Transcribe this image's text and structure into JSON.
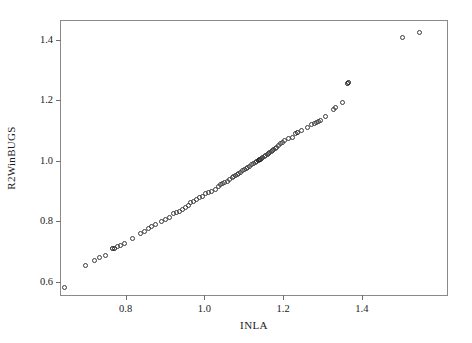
{
  "chart_data": {
    "type": "scatter",
    "title": "",
    "xlabel": "INLA",
    "ylabel": "R2WinBUGS",
    "xlim": [
      0.636,
      1.616
    ],
    "ylim": [
      0.557,
      1.462
    ],
    "xticks": [
      0.8,
      1.0,
      1.2,
      1.4
    ],
    "xticklabels": [
      "0.8",
      "1.0",
      "1.2",
      "1.4"
    ],
    "yticks": [
      0.6,
      0.8,
      1.0,
      1.2,
      1.4
    ],
    "yticklabels": [
      "0.6",
      "0.8",
      "1.0",
      "1.2",
      "1.4"
    ],
    "grid": false,
    "legend": null,
    "marker": "open-circle",
    "marker_color": "#3a3a3a",
    "points": [
      {
        "x": 0.644,
        "y": 0.581
      },
      {
        "x": 0.697,
        "y": 0.653
      },
      {
        "x": 0.72,
        "y": 0.672
      },
      {
        "x": 0.733,
        "y": 0.681
      },
      {
        "x": 0.748,
        "y": 0.688
      },
      {
        "x": 0.767,
        "y": 0.709,
        "dark": true
      },
      {
        "x": 0.772,
        "y": 0.712,
        "dark": true
      },
      {
        "x": 0.78,
        "y": 0.716
      },
      {
        "x": 0.788,
        "y": 0.722
      },
      {
        "x": 0.798,
        "y": 0.728
      },
      {
        "x": 0.818,
        "y": 0.744
      },
      {
        "x": 0.838,
        "y": 0.759
      },
      {
        "x": 0.848,
        "y": 0.766
      },
      {
        "x": 0.858,
        "y": 0.775
      },
      {
        "x": 0.866,
        "y": 0.784
      },
      {
        "x": 0.876,
        "y": 0.791
      },
      {
        "x": 0.891,
        "y": 0.8
      },
      {
        "x": 0.901,
        "y": 0.806
      },
      {
        "x": 0.911,
        "y": 0.812
      },
      {
        "x": 0.921,
        "y": 0.825
      },
      {
        "x": 0.929,
        "y": 0.831
      },
      {
        "x": 0.936,
        "y": 0.834
      },
      {
        "x": 0.944,
        "y": 0.841
      },
      {
        "x": 0.951,
        "y": 0.847
      },
      {
        "x": 0.959,
        "y": 0.853
      },
      {
        "x": 0.964,
        "y": 0.862
      },
      {
        "x": 0.972,
        "y": 0.866
      },
      {
        "x": 0.979,
        "y": 0.872
      },
      {
        "x": 0.987,
        "y": 0.878
      },
      {
        "x": 0.995,
        "y": 0.881
      },
      {
        "x": 1.002,
        "y": 0.891
      },
      {
        "x": 1.01,
        "y": 0.894
      },
      {
        "x": 1.018,
        "y": 0.9
      },
      {
        "x": 1.028,
        "y": 0.906
      },
      {
        "x": 1.036,
        "y": 0.916
      },
      {
        "x": 1.041,
        "y": 0.922
      },
      {
        "x": 1.046,
        "y": 0.925
      },
      {
        "x": 1.051,
        "y": 0.928
      },
      {
        "x": 1.059,
        "y": 0.931
      },
      {
        "x": 1.064,
        "y": 0.937
      },
      {
        "x": 1.071,
        "y": 0.944
      },
      {
        "x": 1.074,
        "y": 0.95
      },
      {
        "x": 1.079,
        "y": 0.953
      },
      {
        "x": 1.084,
        "y": 0.956
      },
      {
        "x": 1.087,
        "y": 0.959
      },
      {
        "x": 1.092,
        "y": 0.962
      },
      {
        "x": 1.097,
        "y": 0.969
      },
      {
        "x": 1.102,
        "y": 0.972
      },
      {
        "x": 1.107,
        "y": 0.975
      },
      {
        "x": 1.11,
        "y": 0.978
      },
      {
        "x": 1.115,
        "y": 0.981
      },
      {
        "x": 1.12,
        "y": 0.987
      },
      {
        "x": 1.125,
        "y": 0.991
      },
      {
        "x": 1.13,
        "y": 0.994
      },
      {
        "x": 1.133,
        "y": 0.997
      },
      {
        "x": 1.138,
        "y": 1.0,
        "dark": true
      },
      {
        "x": 1.14,
        "y": 1.003,
        "dark": true
      },
      {
        "x": 1.143,
        "y": 1.006,
        "dark": true
      },
      {
        "x": 1.146,
        "y": 1.009
      },
      {
        "x": 1.148,
        "y": 1.012
      },
      {
        "x": 1.153,
        "y": 1.016
      },
      {
        "x": 1.156,
        "y": 1.019
      },
      {
        "x": 1.161,
        "y": 1.022
      },
      {
        "x": 1.163,
        "y": 1.025
      },
      {
        "x": 1.166,
        "y": 1.028
      },
      {
        "x": 1.171,
        "y": 1.031
      },
      {
        "x": 1.174,
        "y": 1.034
      },
      {
        "x": 1.176,
        "y": 1.038
      },
      {
        "x": 1.181,
        "y": 1.041
      },
      {
        "x": 1.184,
        "y": 1.044
      },
      {
        "x": 1.189,
        "y": 1.05
      },
      {
        "x": 1.194,
        "y": 1.056
      },
      {
        "x": 1.199,
        "y": 1.062
      },
      {
        "x": 1.204,
        "y": 1.066
      },
      {
        "x": 1.214,
        "y": 1.075
      },
      {
        "x": 1.224,
        "y": 1.078
      },
      {
        "x": 1.232,
        "y": 1.091
      },
      {
        "x": 1.237,
        "y": 1.094,
        "dark": true
      },
      {
        "x": 1.247,
        "y": 1.1
      },
      {
        "x": 1.262,
        "y": 1.109
      },
      {
        "x": 1.272,
        "y": 1.119
      },
      {
        "x": 1.28,
        "y": 1.125
      },
      {
        "x": 1.285,
        "y": 1.128
      },
      {
        "x": 1.29,
        "y": 1.131
      },
      {
        "x": 1.295,
        "y": 1.134
      },
      {
        "x": 1.308,
        "y": 1.147
      },
      {
        "x": 1.328,
        "y": 1.169
      },
      {
        "x": 1.333,
        "y": 1.175
      },
      {
        "x": 1.351,
        "y": 1.194
      },
      {
        "x": 1.363,
        "y": 1.256,
        "dark": true
      },
      {
        "x": 1.366,
        "y": 1.259,
        "dark": true
      },
      {
        "x": 1.503,
        "y": 1.406
      },
      {
        "x": 1.546,
        "y": 1.425
      }
    ]
  }
}
